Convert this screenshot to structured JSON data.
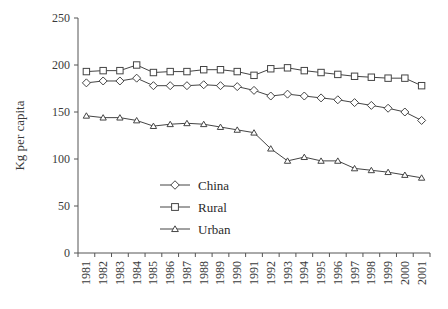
{
  "chart_data": {
    "type": "line",
    "title": "",
    "subtitle": "",
    "xlabel": "",
    "ylabel": "Kg per capita",
    "ylim": [
      0,
      250
    ],
    "ytick_values": [
      0,
      50,
      100,
      150,
      200,
      250
    ],
    "ytick_labels": [
      "0",
      "50",
      "100",
      "150",
      "200",
      "250"
    ],
    "grid": false,
    "legend_position": "inside-lower-center",
    "categories": [
      "1981",
      "1982",
      "1983",
      "1984",
      "1985",
      "1986",
      "1987",
      "1988",
      "1989",
      "1990",
      "1991",
      "1992",
      "1993",
      "1994",
      "1995",
      "1996",
      "1997",
      "1998",
      "1999",
      "2000",
      "2001"
    ],
    "series": [
      {
        "name": "China",
        "marker": "diamond",
        "color": "#444444",
        "values": [
          181,
          183,
          183,
          186,
          178,
          178,
          178,
          179,
          178,
          177,
          173,
          167,
          169,
          167,
          165,
          163,
          160,
          157,
          154,
          150,
          141
        ]
      },
      {
        "name": "Rural",
        "marker": "square",
        "color": "#444444",
        "values": [
          193,
          194,
          194,
          200,
          192,
          193,
          193,
          195,
          195,
          193,
          189,
          196,
          197,
          194,
          192,
          190,
          188,
          187,
          186,
          186,
          178
        ]
      },
      {
        "name": "Urban",
        "marker": "triangle",
        "color": "#444444",
        "values": [
          146,
          144,
          144,
          141,
          135,
          137,
          138,
          137,
          134,
          131,
          128,
          111,
          98,
          102,
          98,
          98,
          90,
          88,
          86,
          83,
          80
        ]
      }
    ]
  },
  "legend": {
    "items": [
      {
        "label": "China",
        "marker": "diamond"
      },
      {
        "label": "Rural",
        "marker": "square"
      },
      {
        "label": "Urban",
        "marker": "triangle"
      }
    ]
  }
}
